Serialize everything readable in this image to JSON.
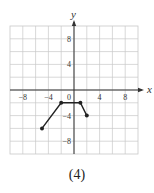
{
  "chart_data": {
    "type": "line",
    "title": "",
    "xlabel": "x",
    "ylabel": "y",
    "xlim": [
      -10,
      10
    ],
    "ylim": [
      -10,
      10
    ],
    "grid": true,
    "grid_step": 2,
    "x_ticks": [
      -8,
      -4,
      0,
      4,
      8
    ],
    "y_ticks": [
      8,
      4,
      -4,
      -8
    ],
    "series": [
      {
        "name": "f",
        "points": [
          [
            -5,
            -6
          ],
          [
            -2,
            -2
          ],
          [
            1,
            -2
          ],
          [
            2,
            -4
          ]
        ],
        "endpoints": "filled"
      }
    ],
    "caption": "(4)"
  },
  "colors": {
    "grid": "#c8c8c8",
    "axis": "#333333",
    "line": "#222222",
    "text": "#333333"
  },
  "labels": {
    "x_axis": "x",
    "y_axis": "y",
    "caption": "(4)"
  }
}
